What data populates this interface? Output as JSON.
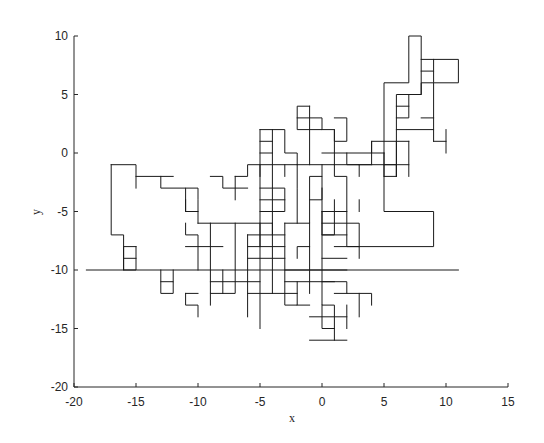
{
  "chart_data": {
    "type": "line",
    "title": "",
    "xlabel": "x",
    "ylabel": "y",
    "xlim": [
      -20,
      15
    ],
    "ylim": [
      -20,
      10
    ],
    "xticks": [
      -20,
      -15,
      -10,
      -5,
      0,
      5,
      10,
      15
    ],
    "yticks": [
      -20,
      -15,
      -10,
      -5,
      0,
      5,
      10
    ],
    "xtick_labels": [
      "-20",
      "-15",
      "-10",
      "-5",
      "0",
      "5",
      "10",
      "15"
    ],
    "ytick_labels": [
      "-20",
      "-15",
      "-10",
      "-5",
      "0",
      "5",
      "10"
    ],
    "grid": false,
    "legend": null,
    "line_color": "#000000",
    "extent": {
      "x_min": -19,
      "x_max": 11,
      "y_min": -16,
      "y_max": 10
    },
    "segments": [
      [
        [
          -19,
          -10
        ],
        [
          11,
          -10
        ]
      ],
      [
        [
          -17,
          -1
        ],
        [
          -17,
          -7
        ],
        [
          -16,
          -7
        ],
        [
          -16,
          -10
        ]
      ],
      [
        [
          -17,
          -1
        ],
        [
          -15,
          -1
        ],
        [
          -15,
          -3
        ]
      ],
      [
        [
          -15,
          -2
        ],
        [
          -12,
          -2
        ]
      ],
      [
        [
          -13,
          -2
        ],
        [
          -13,
          -3
        ],
        [
          -11,
          -3
        ],
        [
          -11,
          -5
        ]
      ],
      [
        [
          -11,
          -3
        ],
        [
          -10,
          -3
        ],
        [
          -10,
          -4
        ],
        [
          -10,
          -6
        ]
      ],
      [
        [
          -11,
          -4
        ],
        [
          -11,
          -5
        ],
        [
          -10,
          -5
        ]
      ],
      [
        [
          -15,
          -8
        ],
        [
          -16,
          -8
        ],
        [
          -16,
          -10
        ],
        [
          -15,
          -10
        ],
        [
          -15,
          -8
        ]
      ],
      [
        [
          -16,
          -9
        ],
        [
          -15,
          -9
        ]
      ],
      [
        [
          -13,
          -11
        ],
        [
          -12,
          -11
        ],
        [
          -12,
          -12
        ],
        [
          -13,
          -12
        ],
        [
          -13,
          -10
        ]
      ],
      [
        [
          -12,
          -10
        ],
        [
          -12,
          -11
        ]
      ],
      [
        [
          -9,
          -2
        ],
        [
          -8,
          -2
        ],
        [
          -8,
          -3
        ],
        [
          -6,
          -3
        ]
      ],
      [
        [
          -7,
          -2
        ],
        [
          -7,
          -4
        ]
      ],
      [
        [
          -7,
          -2
        ],
        [
          -6,
          -2
        ],
        [
          -6,
          -1
        ],
        [
          4,
          -1
        ]
      ],
      [
        [
          -5,
          -1
        ],
        [
          -5,
          -2
        ]
      ],
      [
        [
          -10,
          -6
        ],
        [
          -4,
          -6
        ]
      ],
      [
        [
          -11,
          -6
        ],
        [
          -11,
          -7
        ],
        [
          -10,
          -7
        ],
        [
          -10,
          -10
        ]
      ],
      [
        [
          -11,
          -8
        ],
        [
          -8,
          -8
        ]
      ],
      [
        [
          -9,
          -6
        ],
        [
          -9,
          -12
        ],
        [
          -7,
          -12
        ],
        [
          -7,
          -6
        ]
      ],
      [
        [
          -9,
          -11
        ],
        [
          -5,
          -11
        ]
      ],
      [
        [
          -9,
          -12
        ],
        [
          -9,
          -13
        ]
      ],
      [
        [
          -11,
          -12
        ],
        [
          -11,
          -13
        ],
        [
          -10,
          -13
        ],
        [
          -10,
          -14
        ]
      ],
      [
        [
          -11,
          -12
        ],
        [
          -10,
          -12
        ]
      ],
      [
        [
          -8,
          -10
        ],
        [
          -8,
          -12
        ]
      ],
      [
        [
          -6,
          -7
        ],
        [
          -6,
          -14
        ]
      ],
      [
        [
          -6,
          -9
        ],
        [
          -3,
          -9
        ]
      ],
      [
        [
          -6,
          -12
        ],
        [
          -2,
          -12
        ]
      ],
      [
        [
          -5,
          -6
        ],
        [
          -5,
          -15
        ]
      ],
      [
        [
          -4,
          -6
        ],
        [
          -4,
          -12
        ]
      ],
      [
        [
          -6,
          -8
        ],
        [
          -3,
          -8
        ]
      ],
      [
        [
          -6,
          -7
        ],
        [
          -3,
          -7
        ]
      ],
      [
        [
          -3,
          -6
        ],
        [
          -3,
          -13
        ],
        [
          -2,
          -13
        ],
        [
          -2,
          -11
        ]
      ],
      [
        [
          -3,
          -10
        ],
        [
          2,
          -10
        ]
      ],
      [
        [
          -3,
          -11
        ],
        [
          1,
          -11
        ]
      ],
      [
        [
          -1,
          -6
        ],
        [
          -1,
          -12
        ]
      ],
      [
        [
          -2,
          -9
        ],
        [
          -2,
          -8
        ],
        [
          -1,
          -8
        ]
      ],
      [
        [
          -5,
          2
        ],
        [
          -5,
          -8
        ]
      ],
      [
        [
          -4,
          2
        ],
        [
          -4,
          -7
        ]
      ],
      [
        [
          -5,
          2
        ],
        [
          -3,
          2
        ],
        [
          -3,
          0
        ],
        [
          -2,
          0
        ],
        [
          -2,
          -1
        ]
      ],
      [
        [
          -5,
          1
        ],
        [
          -4,
          1
        ]
      ],
      [
        [
          -5,
          0
        ],
        [
          -4,
          0
        ]
      ],
      [
        [
          -5,
          -3
        ],
        [
          -3,
          -3
        ],
        [
          -3,
          -5
        ],
        [
          -5,
          -5
        ]
      ],
      [
        [
          -5,
          -4
        ],
        [
          -3,
          -4
        ]
      ],
      [
        [
          -3,
          -1
        ],
        [
          -3,
          -2
        ]
      ],
      [
        [
          -2,
          -1
        ],
        [
          -2,
          -3
        ],
        [
          -2,
          -6
        ]
      ],
      [
        [
          -3,
          -6
        ],
        [
          -1,
          -6
        ],
        [
          -1,
          -2
        ],
        [
          0,
          -2
        ],
        [
          0,
          -4
        ],
        [
          -1,
          -4
        ]
      ],
      [
        [
          -1,
          -1
        ],
        [
          -1,
          4
        ]
      ],
      [
        [
          -2,
          3
        ],
        [
          0,
          3
        ],
        [
          0,
          2
        ],
        [
          -2,
          2
        ],
        [
          -2,
          4
        ],
        [
          -1,
          4
        ]
      ],
      [
        [
          1,
          3
        ],
        [
          2,
          3
        ],
        [
          2,
          1
        ],
        [
          1,
          1
        ],
        [
          1,
          2
        ]
      ],
      [
        [
          0,
          2
        ],
        [
          1,
          2
        ],
        [
          1,
          -1
        ]
      ],
      [
        [
          1,
          -1
        ],
        [
          1,
          -2
        ],
        [
          2,
          -2
        ],
        [
          2,
          -8
        ],
        [
          3,
          -8
        ],
        [
          3,
          -9
        ]
      ],
      [
        [
          0,
          -1
        ],
        [
          0,
          -2
        ]
      ],
      [
        [
          0,
          0
        ],
        [
          4,
          0
        ],
        [
          4,
          1
        ],
        [
          7,
          1
        ]
      ],
      [
        [
          2,
          0
        ],
        [
          2,
          -1
        ],
        [
          3,
          -1
        ],
        [
          3,
          -2
        ]
      ],
      [
        [
          1,
          -4
        ],
        [
          1,
          -7
        ],
        [
          0,
          -7
        ],
        [
          0,
          -5
        ]
      ],
      [
        [
          0,
          -3
        ],
        [
          0,
          -13
        ],
        [
          1,
          -13
        ],
        [
          1,
          -16
        ]
      ],
      [
        [
          0,
          -5
        ],
        [
          2,
          -5
        ]
      ],
      [
        [
          0,
          -6
        ],
        [
          3,
          -6
        ],
        [
          3,
          -8
        ]
      ],
      [
        [
          0,
          -7
        ],
        [
          2,
          -7
        ]
      ],
      [
        [
          0,
          -9
        ],
        [
          2,
          -9
        ]
      ],
      [
        [
          0,
          -11
        ],
        [
          2,
          -11
        ],
        [
          2,
          -12
        ],
        [
          4,
          -12
        ],
        [
          4,
          -13
        ]
      ],
      [
        [
          1,
          -12
        ],
        [
          2,
          -12
        ]
      ],
      [
        [
          3,
          -12
        ],
        [
          3,
          -14
        ]
      ],
      [
        [
          -1,
          -14
        ],
        [
          2,
          -14
        ]
      ],
      [
        [
          -1,
          -16
        ],
        [
          2,
          -16
        ]
      ],
      [
        [
          1,
          -15
        ],
        [
          0,
          -15
        ],
        [
          0,
          -13
        ]
      ],
      [
        [
          2,
          -13
        ],
        [
          2,
          -15
        ]
      ],
      [
        [
          -2,
          -13
        ],
        [
          -1,
          -13
        ]
      ],
      [
        [
          3,
          -4
        ],
        [
          3,
          -5
        ]
      ],
      [
        [
          4,
          1
        ],
        [
          4,
          -1
        ],
        [
          6,
          -1
        ],
        [
          6,
          -2
        ],
        [
          5,
          -2
        ],
        [
          5,
          -5
        ],
        [
          9,
          -5
        ],
        [
          9,
          -8
        ],
        [
          1,
          -8
        ]
      ],
      [
        [
          6,
          -2
        ],
        [
          6,
          5
        ],
        [
          8,
          5
        ],
        [
          8,
          10
        ],
        [
          7,
          10
        ],
        [
          7,
          6
        ],
        [
          5,
          6
        ],
        [
          5,
          -2
        ]
      ],
      [
        [
          5,
          0
        ],
        [
          5,
          -2
        ]
      ],
      [
        [
          6,
          1
        ],
        [
          6,
          -2
        ]
      ],
      [
        [
          7,
          1
        ],
        [
          7,
          -2
        ]
      ],
      [
        [
          5,
          -1
        ],
        [
          7,
          -1
        ]
      ],
      [
        [
          6,
          2
        ],
        [
          9,
          2
        ],
        [
          9,
          1
        ]
      ],
      [
        [
          6,
          3
        ],
        [
          7,
          3
        ],
        [
          7,
          5
        ]
      ],
      [
        [
          7,
          4
        ],
        [
          6,
          4
        ]
      ],
      [
        [
          8,
          5
        ],
        [
          8,
          6
        ],
        [
          9,
          6
        ],
        [
          9,
          2
        ]
      ],
      [
        [
          8,
          3
        ],
        [
          9,
          3
        ]
      ],
      [
        [
          8,
          8
        ],
        [
          11,
          8
        ],
        [
          11,
          6
        ],
        [
          9,
          6
        ],
        [
          9,
          7
        ],
        [
          8,
          7
        ]
      ],
      [
        [
          9,
          8
        ],
        [
          9,
          7
        ]
      ],
      [
        [
          4,
          0
        ],
        [
          5,
          0
        ]
      ],
      [
        [
          3,
          -1
        ],
        [
          4,
          -1
        ]
      ],
      [
        [
          9,
          1
        ],
        [
          10,
          1
        ]
      ],
      [
        [
          10,
          0
        ],
        [
          10,
          2
        ]
      ]
    ]
  }
}
